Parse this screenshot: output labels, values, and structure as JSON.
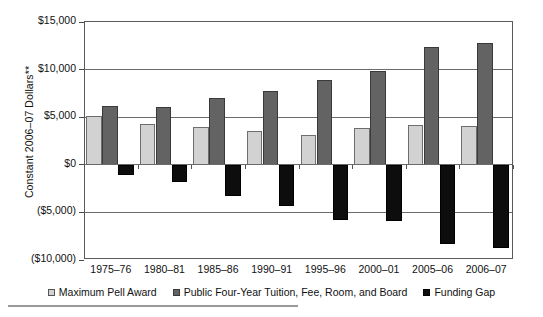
{
  "chart_data": {
    "type": "bar",
    "title": "",
    "xlabel": "",
    "ylabel": "Constant 2006–07 Dollars**",
    "ylim": [
      -10000,
      15000
    ],
    "ytick_labels": [
      "$15,000",
      "$10,000",
      "$5,000",
      "$0",
      "($5,000)",
      "($10,000)"
    ],
    "ytick_values": [
      15000,
      10000,
      5000,
      0,
      -5000,
      -10000
    ],
    "grid": true,
    "legend_position": "bottom",
    "categories": [
      "1975–76",
      "1980–81",
      "1985–86",
      "1990–91",
      "1995–96",
      "2000–01",
      "2005–06",
      "2006–07"
    ],
    "series": [
      {
        "name": "Maximum Pell Award",
        "color": "#d2d2d2",
        "values": [
          5100,
          4250,
          3950,
          3500,
          3150,
          3850,
          4200,
          4100
        ]
      },
      {
        "name": "Public Four-Year Tuition, Fee, Room, and Board",
        "color": "#636363",
        "values": [
          6200,
          6050,
          7050,
          7800,
          8950,
          9900,
          12400,
          12750
        ]
      },
      {
        "name": "Funding Gap",
        "color": "#0d0d0d",
        "values": [
          -1050,
          -1850,
          -3250,
          -4350,
          -5800,
          -5950,
          -8300,
          -8700
        ]
      }
    ]
  },
  "figure": {
    "caption": ""
  }
}
